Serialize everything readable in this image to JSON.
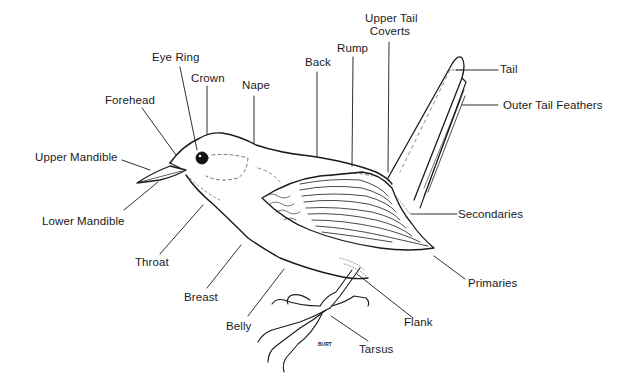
{
  "diagram": {
    "labels": [
      {
        "id": "eye-ring",
        "text": "Eye Ring"
      },
      {
        "id": "crown",
        "text": "Crown"
      },
      {
        "id": "forehead",
        "text": "Forehead"
      },
      {
        "id": "nape",
        "text": "Nape"
      },
      {
        "id": "back",
        "text": "Back"
      },
      {
        "id": "rump",
        "text": "Rump"
      },
      {
        "id": "upper-tail-coverts",
        "text": "Upper Tail Coverts",
        "lines": [
          "Upper Tail",
          "Coverts"
        ]
      },
      {
        "id": "tail",
        "text": "Tail"
      },
      {
        "id": "outer-tail-feathers",
        "text": "Outer Tail Feathers"
      },
      {
        "id": "upper-mandible",
        "text": "Upper Mandible"
      },
      {
        "id": "lower-mandible",
        "text": "Lower Mandible"
      },
      {
        "id": "throat",
        "text": "Throat"
      },
      {
        "id": "breast",
        "text": "Breast"
      },
      {
        "id": "belly",
        "text": "Belly"
      },
      {
        "id": "secondaries",
        "text": "Secondaries"
      },
      {
        "id": "primaries",
        "text": "Primaries"
      },
      {
        "id": "flank",
        "text": "Flank"
      },
      {
        "id": "tarsus",
        "text": "Tarsus"
      }
    ],
    "signature": "BURT"
  }
}
